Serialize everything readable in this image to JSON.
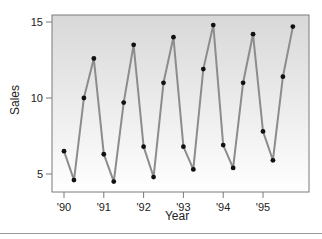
{
  "chart_data": {
    "type": "line",
    "title": "",
    "xlabel": "Year",
    "ylabel": "Sales",
    "ylim": [
      4,
      15.5
    ],
    "yticks": [
      5,
      10,
      15
    ],
    "xtick_labels": [
      "'90",
      "'91",
      "'92",
      "'93",
      "'94",
      "'95"
    ],
    "grid": false,
    "legend": null,
    "series": [
      {
        "name": "Sales",
        "color": "#8c8c8c",
        "marker_color": "#111111",
        "x": [
          1990.0,
          1990.25,
          1990.5,
          1990.75,
          1991.0,
          1991.25,
          1991.5,
          1991.75,
          1992.0,
          1992.25,
          1992.5,
          1992.75,
          1993.0,
          1993.25,
          1993.5,
          1993.75,
          1994.0,
          1994.25,
          1994.5,
          1994.75,
          1995.0,
          1995.25,
          1995.5,
          1995.75
        ],
        "values": [
          6.5,
          4.6,
          10.0,
          12.6,
          6.3,
          4.5,
          9.7,
          13.5,
          6.8,
          4.8,
          11.0,
          14.0,
          6.8,
          5.3,
          11.9,
          14.8,
          6.9,
          5.4,
          11.0,
          14.2,
          7.8,
          5.9,
          11.4,
          14.7
        ]
      }
    ]
  },
  "colors": {
    "plot_bg_top": "#d8d8d8",
    "plot_bg_bottom": "#ffffff",
    "frame": "#7a7a7a",
    "line": "#8c8c8c",
    "marker": "#111111"
  }
}
